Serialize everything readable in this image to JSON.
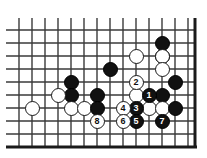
{
  "figure": {
    "kind": "go-board-diagram",
    "colors": {
      "board_background": "#ffffff",
      "grid_line": "#3a3a3a",
      "board_edge": "#1a1a1a",
      "black_stone": "#111111",
      "white_stone": "#ffffff",
      "black_label_text": "#ffffff",
      "white_label_text": "#111111"
    }
  },
  "board": {
    "geometry": {
      "cell_size": 13,
      "stone_diameter": 15,
      "origin_x": 19,
      "origin_y": 30,
      "columns": 14,
      "rows": 10,
      "edge_bottom_y": 147,
      "edge_right_x": 195,
      "grid_left_cut_x": 6
    },
    "lines": {
      "vertical_x": [
        19,
        32,
        45,
        58,
        71,
        84,
        97,
        110,
        123,
        136,
        149,
        162,
        175,
        188
      ],
      "horizontal_y": [
        30,
        43,
        56,
        69,
        82,
        95,
        108,
        121,
        134,
        147
      ],
      "bottom_edge_thick": true,
      "right_edge_thick": true
    },
    "stones": [
      {
        "id": "b-a",
        "color": "black",
        "label": "",
        "x": 162,
        "y": 43
      },
      {
        "id": "b-b",
        "color": "black",
        "label": "",
        "x": 162,
        "y": 56
      },
      {
        "id": "w-a",
        "color": "white",
        "label": "",
        "x": 136,
        "y": 56
      },
      {
        "id": "w-b",
        "color": "white",
        "label": "",
        "x": 162,
        "y": 56
      },
      {
        "id": "w-c",
        "color": "white",
        "label": "",
        "x": 162,
        "y": 69
      },
      {
        "id": "b-c",
        "color": "black",
        "label": "",
        "x": 110,
        "y": 69
      },
      {
        "id": "b-d",
        "color": "black",
        "label": "",
        "x": 175,
        "y": 82
      },
      {
        "id": "b-e",
        "color": "black",
        "label": "",
        "x": 71,
        "y": 82
      },
      {
        "id": "b-f",
        "color": "black",
        "label": "",
        "x": 71,
        "y": 95
      },
      {
        "id": "w-d",
        "color": "white",
        "label": "",
        "x": 58,
        "y": 95
      },
      {
        "id": "b-g",
        "color": "black",
        "label": "",
        "x": 97,
        "y": 95
      },
      {
        "id": "w-e",
        "color": "white",
        "label": "",
        "x": 136,
        "y": 95
      },
      {
        "id": "b-h",
        "color": "black",
        "label": "",
        "x": 162,
        "y": 95
      },
      {
        "id": "w-f",
        "color": "white",
        "label": "",
        "x": 32,
        "y": 108
      },
      {
        "id": "w-g",
        "color": "white",
        "label": "",
        "x": 71,
        "y": 108
      },
      {
        "id": "w-h",
        "color": "white",
        "label": "",
        "x": 84,
        "y": 108
      },
      {
        "id": "b-i",
        "color": "black",
        "label": "",
        "x": 97,
        "y": 108
      },
      {
        "id": "w-i",
        "color": "white",
        "label": "",
        "x": 149,
        "y": 108
      },
      {
        "id": "w-j",
        "color": "white",
        "label": "",
        "x": 162,
        "y": 108
      },
      {
        "id": "b-j",
        "color": "black",
        "label": "",
        "x": 175,
        "y": 108
      },
      {
        "id": "m1",
        "color": "black",
        "label": "1",
        "x": 149,
        "y": 95
      },
      {
        "id": "m2",
        "color": "white",
        "label": "2",
        "x": 136,
        "y": 82
      },
      {
        "id": "m3",
        "color": "black",
        "label": "3",
        "x": 136,
        "y": 108
      },
      {
        "id": "m4",
        "color": "white",
        "label": "4",
        "x": 123,
        "y": 108
      },
      {
        "id": "m5",
        "color": "black",
        "label": "5",
        "x": 136,
        "y": 121
      },
      {
        "id": "m6",
        "color": "white",
        "label": "6",
        "x": 123,
        "y": 121
      },
      {
        "id": "m7",
        "color": "black",
        "label": "7",
        "x": 162,
        "y": 121
      },
      {
        "id": "m8",
        "color": "white",
        "label": "8",
        "x": 97,
        "y": 121
      }
    ],
    "move_sequence": [
      "1",
      "2",
      "3",
      "4",
      "5",
      "6",
      "7",
      "8"
    ]
  }
}
